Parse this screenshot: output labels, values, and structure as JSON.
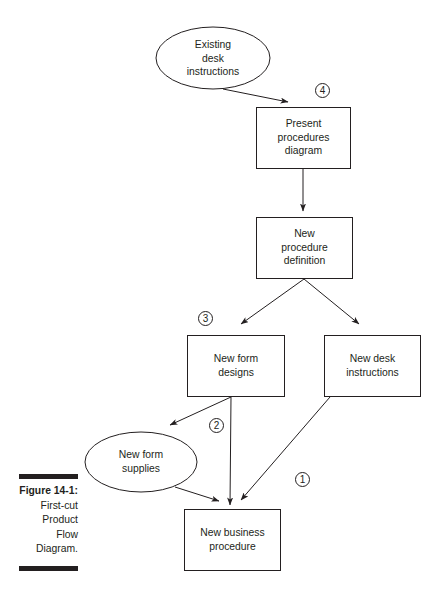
{
  "figure": {
    "label": "Figure 14-1:",
    "caption_lines": [
      "First-cut",
      "Product",
      "Flow",
      "Diagram."
    ]
  },
  "nodes": {
    "existing_desk_instructions": {
      "shape": "ellipse",
      "lines": [
        "Existing",
        "desk",
        "instructions"
      ]
    },
    "present_procedures_diagram": {
      "shape": "box",
      "lines": [
        "Present",
        "procedures",
        "diagram"
      ]
    },
    "new_procedure_definition": {
      "shape": "box",
      "lines": [
        "New",
        "procedure",
        "definition"
      ]
    },
    "new_form_designs": {
      "shape": "box",
      "lines": [
        "New form",
        "designs"
      ]
    },
    "new_desk_instructions": {
      "shape": "box",
      "lines": [
        "New desk",
        "instructions"
      ]
    },
    "new_form_supplies": {
      "shape": "ellipse",
      "lines": [
        "New form",
        "supplies"
      ]
    },
    "new_business_procedure": {
      "shape": "box",
      "lines": [
        "New business",
        "procedure"
      ]
    }
  },
  "markers": {
    "m1": "1",
    "m2": "2",
    "m3": "3",
    "m4": "4"
  },
  "edges": [
    {
      "from": "Existing desk instructions",
      "to": "Present procedures diagram"
    },
    {
      "from": "Present procedures diagram",
      "to": "New procedure definition"
    },
    {
      "from": "New procedure definition",
      "to": "New form designs"
    },
    {
      "from": "New procedure definition",
      "to": "New desk instructions"
    },
    {
      "from": "New form designs",
      "to": "New form supplies"
    },
    {
      "from": "New form designs",
      "to": "New business procedure"
    },
    {
      "from": "New desk instructions",
      "to": "New business procedure"
    },
    {
      "from": "New form supplies",
      "to": "New business procedure"
    }
  ]
}
